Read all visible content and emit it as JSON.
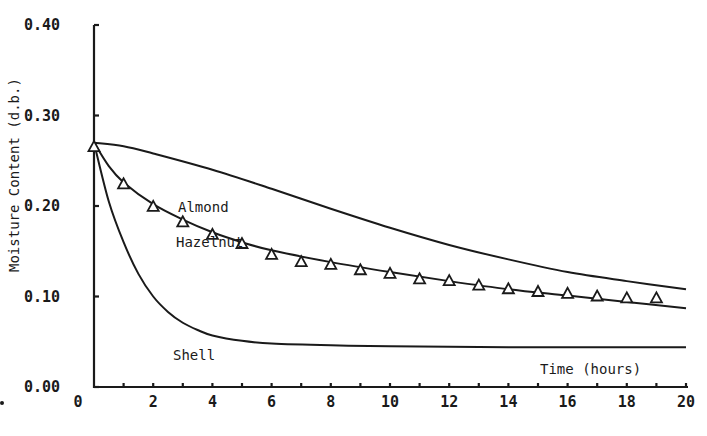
{
  "chart_data": {
    "type": "line",
    "title": "",
    "xlabel": "Time (hours)",
    "ylabel": "Moisture Content (d.b.)",
    "xlim": [
      0,
      20
    ],
    "ylim": [
      0.0,
      0.4
    ],
    "grid": false,
    "legend": "inline labels",
    "x_ticks": [
      "0",
      "2",
      "4",
      "6",
      "8",
      "10",
      "12",
      "14",
      "16",
      "18",
      "20"
    ],
    "x_minor_tick_step": 1,
    "y_ticks": [
      "0.00",
      "0.10",
      "0.20",
      "0.30",
      "0.40"
    ],
    "series": [
      {
        "name": "Almond",
        "style": "line",
        "x": [
          0,
          1,
          2,
          4,
          6,
          8,
          10,
          12,
          14,
          16,
          18,
          20
        ],
        "values": [
          0.27,
          0.266,
          0.258,
          0.24,
          0.219,
          0.197,
          0.176,
          0.157,
          0.141,
          0.127,
          0.117,
          0.108
        ]
      },
      {
        "name": "Hazelnut",
        "style": "line",
        "x": [
          0,
          0.5,
          1,
          2,
          3,
          4,
          5,
          6,
          8,
          10,
          12,
          14,
          16,
          18,
          20
        ],
        "values": [
          0.27,
          0.244,
          0.226,
          0.202,
          0.185,
          0.171,
          0.16,
          0.151,
          0.138,
          0.127,
          0.117,
          0.108,
          0.101,
          0.094,
          0.087
        ]
      },
      {
        "name": "Shell",
        "style": "line",
        "x": [
          0,
          0.5,
          1,
          1.5,
          2,
          2.5,
          3,
          3.5,
          4,
          5,
          6,
          8,
          10,
          14,
          20
        ],
        "values": [
          0.27,
          0.205,
          0.16,
          0.125,
          0.1,
          0.083,
          0.071,
          0.063,
          0.057,
          0.051,
          0.048,
          0.046,
          0.045,
          0.044,
          0.044
        ]
      },
      {
        "name": "Hazelnut (experimental)",
        "style": "triangle-markers",
        "x": [
          0,
          1,
          2,
          3,
          4,
          5,
          6,
          7,
          8,
          9,
          10,
          11,
          12,
          13,
          14,
          15,
          16,
          17,
          18,
          19
        ],
        "values": [
          0.265,
          0.224,
          0.199,
          0.182,
          0.168,
          0.158,
          0.146,
          0.138,
          0.135,
          0.129,
          0.125,
          0.119,
          0.117,
          0.112,
          0.108,
          0.105,
          0.103,
          0.1,
          0.098,
          0.098
        ]
      }
    ],
    "annotations": [
      {
        "text": "Almond",
        "x": 3.0,
        "y": 0.197
      },
      {
        "text": "Hazelnut",
        "x": 2.8,
        "y": 0.158
      },
      {
        "text": "Shell",
        "x": 2.7,
        "y": 0.03
      },
      {
        "text": "Time (hours)",
        "x": 15.0,
        "y": 0.015
      }
    ]
  }
}
